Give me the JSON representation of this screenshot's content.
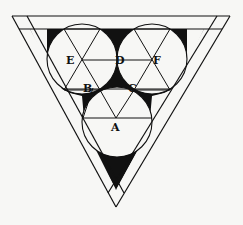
{
  "figure": {
    "colors": {
      "ink": "#111111",
      "paper": "#f7f7f5",
      "fill": "#111111"
    },
    "labels": {
      "A": "A",
      "B": "B",
      "C": "C",
      "D": "D",
      "E": "E",
      "F": "F"
    },
    "circles": [
      {
        "name": "circle-E",
        "cx": 82,
        "cy": 59,
        "r": 35
      },
      {
        "name": "circle-F",
        "cx": 152,
        "cy": 59,
        "r": 35
      },
      {
        "name": "circle-A",
        "cx": 117,
        "cy": 122,
        "r": 35
      }
    ],
    "points": {
      "A": [
        116,
        118
      ],
      "B": [
        93,
        88
      ],
      "C": [
        139,
        88
      ],
      "D": [
        117,
        60
      ],
      "E": [
        82,
        60
      ],
      "F": [
        152,
        60
      ]
    }
  }
}
